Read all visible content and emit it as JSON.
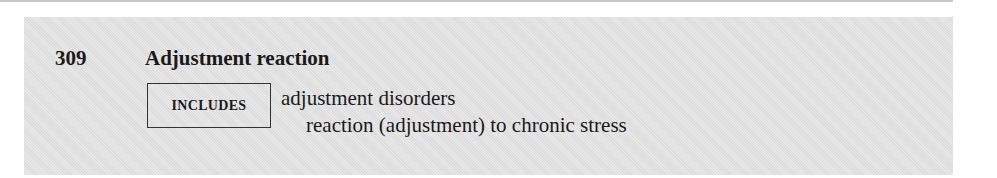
{
  "entry": {
    "code": "309",
    "title": "Adjustment reaction",
    "includes_label": "INCLUDES",
    "includes": [
      "adjustment disorders",
      "reaction (adjustment) to chronic stress"
    ]
  },
  "colors": {
    "box_background": "#e3e3e3",
    "text": "#1a1a1a",
    "rule": "#c8c8c8"
  }
}
